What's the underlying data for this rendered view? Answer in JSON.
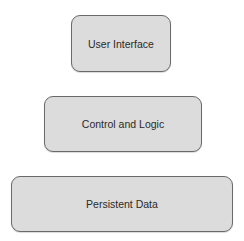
{
  "diagram": {
    "type": "layered-architecture",
    "layers": [
      {
        "label": "User Interface"
      },
      {
        "label": "Control and Logic"
      },
      {
        "label": "Persistent Data"
      }
    ],
    "colors": {
      "box_fill": "#dcdcdc",
      "box_border": "#6a6a6a",
      "text": "#2a2a2a",
      "background": "#ffffff"
    }
  }
}
